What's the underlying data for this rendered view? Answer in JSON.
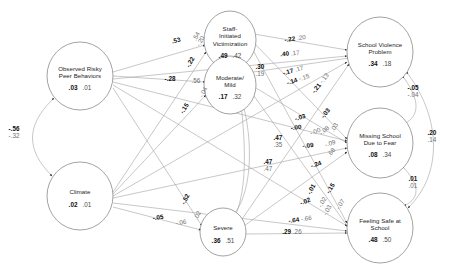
{
  "diagram": {
    "nodes": [
      {
        "id": "observed_risky_peer",
        "label": "Observed Risky\nPeer Behaviors",
        "estimate": ".03",
        "secondary": ".01",
        "cx": 80,
        "cy": 76,
        "rx": 33,
        "ry": 34
      },
      {
        "id": "climate",
        "label": "Climate",
        "estimate": ".02",
        "secondary": ".01",
        "cx": 80,
        "cy": 196,
        "rx": 33,
        "ry": 34
      },
      {
        "id": "staff_initiated_victimization",
        "label": "Staff-\nInitiated\nVictimization",
        "estimate": ".49",
        "secondary": ".42",
        "cx": 230,
        "cy": 40,
        "rx": 26,
        "ry": 29
      },
      {
        "id": "moderate_mild",
        "label": "Moderate/\nMild",
        "estimate": ".17",
        "secondary": ".32",
        "cx": 230,
        "cy": 85,
        "rx": 26,
        "ry": 29
      },
      {
        "id": "severe",
        "label": "Severe",
        "estimate": ".36",
        "secondary": ".51",
        "cx": 223,
        "cy": 232,
        "rx": 23,
        "ry": 24
      },
      {
        "id": "school_violence_problem",
        "label": "School Violence\nProblem",
        "estimate": ".34",
        "secondary": ".18",
        "cx": 380,
        "cy": 52,
        "rx": 33,
        "ry": 35
      },
      {
        "id": "missing_school_due_to_fear",
        "label": "Missing School\nDue to Fear",
        "estimate": ".08",
        "secondary": ".34",
        "cx": 380,
        "cy": 143,
        "rx": 33,
        "ry": 35
      },
      {
        "id": "feeling_safe_at_school",
        "label": "Feeling Safe at\nSchool",
        "estimate": ".48",
        "secondary": ".50",
        "cx": 380,
        "cy": 228,
        "rx": 33,
        "ry": 35
      }
    ],
    "path_labels": [
      {
        "id": "p-53",
        "bold": ".53",
        "gray": "",
        "x": 176,
        "y": 40,
        "rot": -13
      },
      {
        "id": "p-54",
        "bold": "",
        "gray": ".54",
        "x": 196,
        "y": 36,
        "rot": -60
      },
      {
        "id": "p-neg20",
        "bold": "",
        "gray": "-.20",
        "x": 200,
        "y": 41,
        "rot": -62
      },
      {
        "id": "p-neg22a",
        "bold": "-.22",
        "gray": "",
        "x": 190,
        "y": 62,
        "rot": -60
      },
      {
        "id": "p-neg28",
        "bold": "-.28",
        "gray": "",
        "x": 170,
        "y": 78,
        "rot": 0
      },
      {
        "id": "p-56",
        "bold": "",
        "gray": ".56",
        "x": 196,
        "y": 80,
        "rot": 0
      },
      {
        "id": "p-neg04",
        "bold": "",
        "gray": "-.04",
        "x": 203,
        "y": 92,
        "rot": -63
      },
      {
        "id": "p-neg15",
        "bold": "-.15",
        "gray": "",
        "x": 184,
        "y": 108,
        "rot": -58
      },
      {
        "id": "p-30",
        "bold": ".30",
        "gray": ".19",
        "x": 260,
        "y": 70,
        "rot": 0,
        "stacked": true
      },
      {
        "id": "p-neg22b",
        "bold": "-.22",
        "gray": ".20",
        "x": 295,
        "y": 38,
        "rot": -8,
        "pair": true
      },
      {
        "id": "p-40",
        "bold": ".40",
        "gray": ".17",
        "x": 290,
        "y": 53,
        "rot": -5,
        "pair": true
      },
      {
        "id": "p-neg17",
        "bold": "-.17",
        "gray": ".17",
        "x": 293,
        "y": 70,
        "rot": -16,
        "pair": true
      },
      {
        "id": "p-neg14",
        "bold": "-.14",
        "gray": "-.15",
        "x": 298,
        "y": 79,
        "rot": -18,
        "pair": true
      },
      {
        "id": "p-neg21",
        "bold": "-.21",
        "gray": "-.13",
        "x": 320,
        "y": 83,
        "rot": -52,
        "pair": true
      },
      {
        "id": "p-neg03a",
        "bold": "-.03",
        "gray": "",
        "x": 300,
        "y": 117,
        "rot": -16
      },
      {
        "id": "p-neg00",
        "bold": "-.00",
        "gray": "",
        "x": 296,
        "y": 127,
        "rot": -8
      },
      {
        "id": "p-neg03b",
        "bold": "-.03",
        "gray": "",
        "x": 325,
        "y": 113,
        "rot": -52
      },
      {
        "id": "p-neg00g",
        "bold": "",
        "gray": "-.00",
        "x": 315,
        "y": 131,
        "rot": -20
      },
      {
        "id": "p-neg08g",
        "bold": "",
        "gray": "-.08",
        "x": 324,
        "y": 130,
        "rot": -40
      },
      {
        "id": "p-03g",
        "bold": "",
        "gray": ".03",
        "x": 334,
        "y": 127,
        "rot": -58
      },
      {
        "id": "p-neg09",
        "bold": "-.09",
        "gray": "",
        "x": 308,
        "y": 145,
        "rot": -6
      },
      {
        "id": "p-neg09g",
        "bold": "",
        "gray": "-.09",
        "x": 330,
        "y": 143,
        "rot": -16
      },
      {
        "id": "p-68g",
        "bold": "",
        "gray": ".68",
        "x": 331,
        "y": 152,
        "rot": -52
      },
      {
        "id": "p-47a",
        "bold": ".47",
        "gray": ".35",
        "x": 278,
        "y": 141,
        "rot": 0,
        "stacked": true
      },
      {
        "id": "p-47b",
        "bold": ".47",
        "gray": ".47",
        "x": 268,
        "y": 165,
        "rot": 0,
        "stacked": true
      },
      {
        "id": "p-neg24",
        "bold": "-.24",
        "gray": "",
        "x": 316,
        "y": 164,
        "rot": -18
      },
      {
        "id": "p-neg01",
        "bold": "-.01",
        "gray": "",
        "x": 311,
        "y": 189,
        "rot": -60
      },
      {
        "id": "p-neg15b",
        "bold": "-.15",
        "gray": "",
        "x": 330,
        "y": 188,
        "rot": -58
      },
      {
        "id": "p-neg02",
        "bold": "-.02",
        "gray": "",
        "x": 305,
        "y": 201,
        "rot": -22
      },
      {
        "id": "p-02g",
        "bold": "",
        "gray": "-.02",
        "x": 322,
        "y": 202,
        "rot": -60
      },
      {
        "id": "p-neg03c",
        "bold": "",
        "gray": "-.03",
        "x": 327,
        "y": 210,
        "rot": -60
      },
      {
        "id": "p-neg07g",
        "bold": "",
        "gray": "-.07",
        "x": 340,
        "y": 204,
        "rot": -58
      },
      {
        "id": "p-neg64",
        "bold": "-.64",
        "gray": "-.66",
        "x": 300,
        "y": 219,
        "rot": -8,
        "pair": true
      },
      {
        "id": "p-29",
        "bold": ".29",
        "gray": ".26",
        "x": 292,
        "y": 231,
        "rot": 0,
        "pair": true
      },
      {
        "id": "p-neg52",
        "bold": "-.52",
        "gray": "",
        "x": 185,
        "y": 199,
        "rot": -62
      },
      {
        "id": "p-neg05",
        "bold": "-.05",
        "gray": "",
        "x": 158,
        "y": 217,
        "rot": -9
      },
      {
        "id": "p-neg06g",
        "bold": "",
        "gray": "-.06",
        "x": 181,
        "y": 222,
        "rot": -9
      },
      {
        "id": "p-02gv",
        "bold": "",
        "gray": ".02",
        "x": 197,
        "y": 215,
        "rot": -62
      }
    ],
    "correlations": [
      {
        "id": "corr-left",
        "bold": "-.56",
        "gray": "-.32",
        "x": 14,
        "y": 132
      },
      {
        "id": "corr-right-top",
        "bold": "-.05",
        "gray": "-.04",
        "x": 413,
        "y": 91
      },
      {
        "id": "corr-right-outer",
        "bold": ".20",
        "gray": ".14",
        "x": 432,
        "y": 136
      },
      {
        "id": "corr-right-bottom",
        "bold": ".01",
        "gray": ".01",
        "x": 413,
        "y": 182
      }
    ]
  }
}
